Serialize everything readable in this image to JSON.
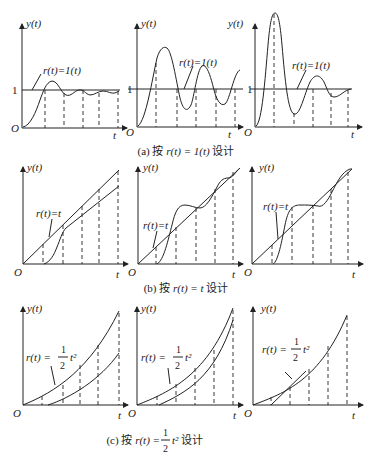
{
  "figure": {
    "rows": [
      {
        "caption_prefix": "(a) 按 ",
        "caption_math": "r(t) = 1(t)",
        "caption_suffix": " 设计",
        "panels": [
          {
            "y_label": "y(t)",
            "x_label": "t",
            "origin_label": "O",
            "level_label": "1",
            "input_label": "r(t)=1(t)"
          },
          {
            "y_label": "y(t)",
            "x_label": "t",
            "origin_label": "O",
            "level_label": "1",
            "input_label": "r(t)=1(t)"
          },
          {
            "y_label": "y(t)",
            "x_label": "t",
            "origin_label": "O",
            "level_label": "1",
            "input_label": "r(t)=1(t)"
          }
        ]
      },
      {
        "caption_prefix": "(b) 按 ",
        "caption_math": "r(t) = t",
        "caption_suffix": " 设计",
        "panels": [
          {
            "y_label": "y(t)",
            "x_label": "t",
            "origin_label": "O",
            "input_label": "r(t)=t"
          },
          {
            "y_label": "y(t)",
            "x_label": "t",
            "origin_label": "O",
            "input_label": "r(t)=t"
          },
          {
            "y_label": "y(t)",
            "x_label": "t",
            "origin_label": "O",
            "input_label": "r(t)=t"
          }
        ]
      },
      {
        "caption_prefix": "(c) 按 ",
        "caption_math": "r(t) =",
        "caption_frac_num": "1",
        "caption_frac_den": "2",
        "caption_power": "t²",
        "caption_suffix": " 设计",
        "panels": [
          {
            "y_label": "y(t)",
            "x_label": "t",
            "origin_label": "O",
            "input_label": "r(t) =",
            "frac_num": "1",
            "frac_den": "2",
            "power": "t²"
          },
          {
            "y_label": "y(t)",
            "x_label": "t",
            "origin_label": "O",
            "input_label": "r(t) =",
            "frac_num": "1",
            "frac_den": "2",
            "power": "t²"
          },
          {
            "y_label": "y(t)",
            "x_label": "t",
            "origin_label": "O",
            "input_label": "r(t) =",
            "frac_num": "1",
            "frac_den": "2",
            "power": "t²"
          }
        ]
      }
    ]
  }
}
